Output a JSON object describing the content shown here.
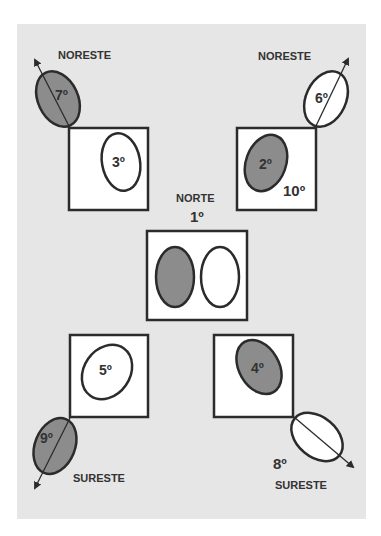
{
  "colors": {
    "page_background": "#ffffff",
    "panel_background": "#e6e6e6",
    "box_fill": "#ffffff",
    "stroke": "#2b2b2b",
    "filled_shape": "#8c8c8c",
    "text": "#333333"
  },
  "labels": {
    "top_left_direction": "NORESTE",
    "top_right_direction": "NORESTE",
    "center_direction": "NORTE",
    "bottom_left_direction": "SURESTE",
    "bottom_right_direction": "SURESTE"
  },
  "positions": {
    "center": "1º",
    "top_right_box": "2º",
    "top_left_box": "3º",
    "bottom_right_box": "4º",
    "bottom_left_box": "5º",
    "top_right_outer": "6º",
    "top_left_outer": "7º",
    "bottom_right_outer": "8º",
    "bottom_left_outer": "9º",
    "top_right_box_second": "10º"
  }
}
